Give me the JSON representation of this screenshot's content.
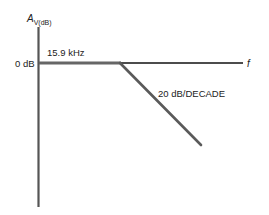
{
  "diagram": {
    "type": "bode-magnitude-plot",
    "y_axis": {
      "label_main": "A",
      "label_sub": "V(dB)"
    },
    "x_axis": {
      "label": "f"
    },
    "reference_level": {
      "label": "0 dB"
    },
    "cutoff": {
      "label": "15.9 kHz"
    },
    "rolloff": {
      "label": "20 dB/DECADE"
    },
    "colors": {
      "axis": "#555555",
      "response": "#666666",
      "frequency_axis": "#111111",
      "text": "#222222"
    }
  }
}
